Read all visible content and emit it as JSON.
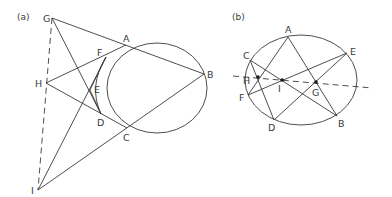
{
  "figures": [
    {
      "caption": "(a)",
      "points": [
        "G",
        "A",
        "B",
        "F",
        "H",
        "E",
        "D",
        "C",
        "I"
      ],
      "labels": {
        "G": "G",
        "A": "A",
        "B": "B",
        "F": "F",
        "H": "H",
        "E": "E",
        "D": "D",
        "C": "C",
        "I": "I"
      },
      "segments": [
        [
          "G",
          "B"
        ],
        [
          "G",
          "D"
        ],
        [
          "H",
          "A"
        ],
        [
          "H",
          "C"
        ],
        [
          "I",
          "F"
        ],
        [
          "I",
          "B"
        ],
        [
          "F",
          "E"
        ],
        [
          "E",
          "D"
        ]
      ],
      "dashed_segments": [
        [
          "G",
          "I"
        ]
      ],
      "conic": "ellipse",
      "marked_points": []
    },
    {
      "caption": "(b)",
      "points": [
        "A",
        "B",
        "C",
        "D",
        "E",
        "F",
        "G",
        "H",
        "I"
      ],
      "labels": {
        "A": "A",
        "B": "B",
        "C": "C",
        "D": "D",
        "E": "E",
        "F": "F",
        "G": "G",
        "H": "H",
        "I": "I"
      },
      "segments": [
        [
          "A",
          "B"
        ],
        [
          "A",
          "F"
        ],
        [
          "C",
          "D"
        ],
        [
          "C",
          "B"
        ],
        [
          "F",
          "E"
        ],
        [
          "E",
          "D"
        ]
      ],
      "dashed_segments": [
        [
          "line-start",
          "line-end"
        ]
      ],
      "conic": "ellipse",
      "marked_points": [
        "H",
        "I",
        "G"
      ]
    }
  ]
}
